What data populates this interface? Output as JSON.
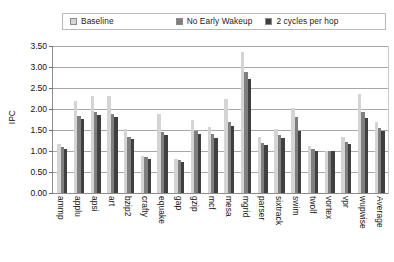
{
  "chart_data": {
    "type": "bar",
    "title": "",
    "xlabel": "",
    "ylabel": "IPC",
    "ylim": [
      0,
      3.5
    ],
    "ytick_step": 0.5,
    "grid": true,
    "legend_position": "top",
    "categories": [
      "ammp",
      "applu",
      "apsi",
      "art",
      "bzip2",
      "crafty",
      "equake",
      "gap",
      "gzip",
      "mcf",
      "mesa",
      "mgrid",
      "parser",
      "sixtrack",
      "swim",
      "twolf",
      "vortex",
      "vpr",
      "wupwise",
      "Average"
    ],
    "ytick_labels": [
      "0.00",
      "0.50",
      "1.00",
      "1.50",
      "2.00",
      "2.50",
      "3.00",
      "3.50"
    ],
    "ytick_values": [
      0.0,
      0.5,
      1.0,
      1.5,
      2.0,
      2.5,
      3.0,
      3.5
    ],
    "series": [
      {
        "name": "Baseline",
        "color": "#d4d4d4",
        "values": [
          1.16,
          2.18,
          2.32,
          2.3,
          1.52,
          0.88,
          1.88,
          0.82,
          1.73,
          1.56,
          2.24,
          3.36,
          1.34,
          1.52,
          2.02,
          1.12,
          1.0,
          1.33,
          2.36,
          1.7
        ]
      },
      {
        "name": "No Early Wakeup",
        "color": "#7f7f7f",
        "values": [
          1.09,
          1.83,
          1.92,
          1.88,
          1.33,
          0.85,
          1.45,
          0.78,
          1.48,
          1.41,
          1.7,
          2.88,
          1.2,
          1.38,
          1.82,
          1.04,
          0.99,
          1.22,
          1.92,
          1.55
        ]
      },
      {
        "name": "2 cycles per hop",
        "color": "#3f3f3f",
        "values": [
          1.04,
          1.76,
          1.85,
          1.8,
          1.28,
          0.82,
          1.38,
          0.74,
          1.41,
          1.32,
          1.6,
          2.72,
          1.14,
          1.32,
          1.48,
          1.0,
          0.99,
          1.16,
          1.78,
          1.47
        ]
      }
    ]
  },
  "legend": {
    "entries": [
      {
        "label": "Baseline"
      },
      {
        "label": "No Early Wakeup"
      },
      {
        "label": "2 cycles per hop"
      }
    ]
  },
  "axes": {
    "y_axis_title": "IPC"
  }
}
